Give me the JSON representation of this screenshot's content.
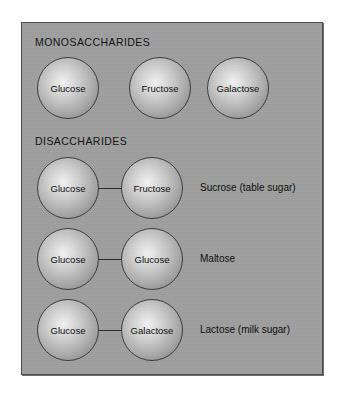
{
  "figure": {
    "panel_background": "#9e9e9e",
    "panel_border": "#4a4a4a",
    "sections": [
      {
        "heading": "MONOSACCHARIDES",
        "molecules": [
          {
            "label": "Glucose"
          },
          {
            "label": "Fructose"
          },
          {
            "label": "Galactose"
          }
        ]
      },
      {
        "heading": "DISACCHARIDES",
        "rows": [
          {
            "left": "Glucose",
            "right": "Fructose",
            "name": "Sucrose (table sugar)"
          },
          {
            "left": "Glucose",
            "right": "Glucose",
            "name": "Maltose"
          },
          {
            "left": "Glucose",
            "right": "Galactose",
            "name": "Lactose (milk sugar)"
          }
        ]
      }
    ]
  }
}
